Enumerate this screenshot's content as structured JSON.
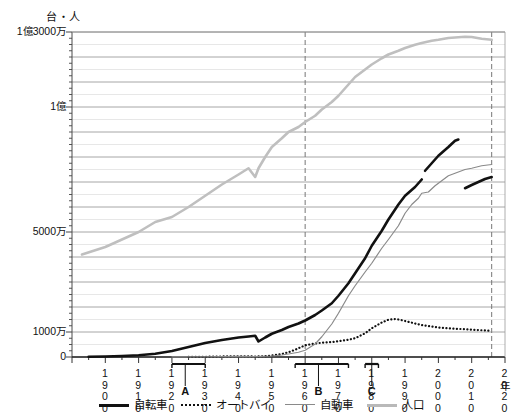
{
  "chart_data": {
    "type": "line",
    "title": "",
    "unit_label": "台・人",
    "xlabel": "年",
    "ylabel": "",
    "grid": true,
    "legend_position": "bottom",
    "xlim": [
      1890,
      2020
    ],
    "ylim": [
      0,
      130000000
    ],
    "y_ticks": [
      {
        "value": 0,
        "label": "0"
      },
      {
        "value": 10000000,
        "label": "1000万"
      },
      {
        "value": 50000000,
        "label": "5000万"
      },
      {
        "value": 100000000,
        "label": "1億"
      },
      {
        "value": 130000000,
        "label": "1億3000万"
      }
    ],
    "y_minor_gridline_step": 5000000,
    "x_ticks": [
      {
        "value": 1900,
        "label": "1900"
      },
      {
        "value": 1910,
        "label": "1910"
      },
      {
        "value": 1920,
        "label": "1920"
      },
      {
        "value": 1930,
        "label": "1930"
      },
      {
        "value": 1940,
        "label": "1940"
      },
      {
        "value": 1950,
        "label": "1950"
      },
      {
        "value": 1960,
        "label": "1960"
      },
      {
        "value": 1970,
        "label": "1970"
      },
      {
        "value": 1980,
        "label": "1980"
      },
      {
        "value": 1990,
        "label": "1990"
      },
      {
        "value": 2000,
        "label": "2000"
      },
      {
        "value": 2010,
        "label": "2010"
      },
      {
        "value": 2020,
        "label": "2020"
      }
    ],
    "vertical_dashed_lines": [
      1960,
      2016
    ],
    "brackets": [
      {
        "label": "A",
        "start": 1920,
        "end": 1930,
        "tick_at": 1924
      },
      {
        "label": "B",
        "start": 1957,
        "end": 1973,
        "tick_at": 1964
      },
      {
        "label": "C",
        "start": 1978,
        "end": 1982,
        "tick_at": 1980
      }
    ],
    "series": [
      {
        "name": "自転車",
        "style": "thick-solid",
        "color": "#111111",
        "segments": [
          [
            [
              1895,
              100000
            ],
            [
              1900,
              200000
            ],
            [
              1905,
              400000
            ],
            [
              1910,
              700000
            ],
            [
              1915,
              1300000
            ],
            [
              1920,
              2400000
            ],
            [
              1925,
              4000000
            ],
            [
              1930,
              5600000
            ],
            [
              1935,
              6800000
            ],
            [
              1938,
              7400000
            ],
            [
              1940,
              7800000
            ],
            [
              1943,
              8200000
            ],
            [
              1945,
              8500000
            ],
            [
              1946,
              6200000
            ],
            [
              1948,
              7800000
            ],
            [
              1950,
              9300000
            ],
            [
              1953,
              10800000
            ],
            [
              1955,
              12000000
            ],
            [
              1958,
              13400000
            ],
            [
              1960,
              14600000
            ],
            [
              1963,
              16800000
            ],
            [
              1965,
              18600000
            ],
            [
              1968,
              21500000
            ],
            [
              1970,
              24500000
            ],
            [
              1973,
              29500000
            ],
            [
              1975,
              33500000
            ],
            [
              1978,
              39500000
            ],
            [
              1980,
              44500000
            ],
            [
              1983,
              50500000
            ],
            [
              1985,
              55000000
            ],
            [
              1988,
              61000000
            ],
            [
              1990,
              64500000
            ],
            [
              1993,
              68000000
            ],
            [
              1995,
              71000000
            ]
          ],
          [
            [
              1996,
              74500000
            ],
            [
              1998,
              77500000
            ],
            [
              2000,
              80500000
            ],
            [
              2003,
              84000000
            ],
            [
              2005,
              86500000
            ],
            [
              2006,
              87000000
            ]
          ],
          [
            [
              2008,
              67500000
            ],
            [
              2010,
              68800000
            ],
            [
              2012,
              70000000
            ],
            [
              2014,
              71200000
            ],
            [
              2016,
              72000000
            ]
          ]
        ]
      },
      {
        "name": "オートバイ",
        "style": "dotted",
        "color": "#111111",
        "segments": [
          [
            [
              1925,
              50000
            ],
            [
              1930,
              100000
            ],
            [
              1935,
              200000
            ],
            [
              1940,
              300000
            ],
            [
              1945,
              200000
            ],
            [
              1948,
              350000
            ],
            [
              1950,
              600000
            ],
            [
              1953,
              1200000
            ],
            [
              1955,
              1900000
            ],
            [
              1957,
              2900000
            ],
            [
              1959,
              4100000
            ],
            [
              1960,
              4700000
            ],
            [
              1963,
              5400000
            ],
            [
              1965,
              5700000
            ],
            [
              1968,
              6000000
            ],
            [
              1970,
              6300000
            ],
            [
              1973,
              6900000
            ],
            [
              1975,
              7500000
            ],
            [
              1978,
              9500000
            ],
            [
              1980,
              11500000
            ],
            [
              1983,
              13800000
            ],
            [
              1985,
              14900000
            ],
            [
              1987,
              15200000
            ],
            [
              1988,
              15000000
            ],
            [
              1990,
              14400000
            ],
            [
              1993,
              13400000
            ],
            [
              1995,
              12800000
            ],
            [
              1998,
              12200000
            ],
            [
              2000,
              11800000
            ],
            [
              2003,
              11500000
            ],
            [
              2005,
              11300000
            ],
            [
              2008,
              11100000
            ],
            [
              2010,
              10900000
            ],
            [
              2013,
              10700000
            ],
            [
              2016,
              10500000
            ]
          ]
        ]
      },
      {
        "name": "自動車",
        "style": "thin-solid",
        "color": "#8a8a8a",
        "segments": [
          [
            [
              1920,
              30000
            ],
            [
              1930,
              100000
            ],
            [
              1935,
              180000
            ],
            [
              1940,
              250000
            ],
            [
              1945,
              150000
            ],
            [
              1950,
              400000
            ],
            [
              1953,
              800000
            ],
            [
              1955,
              1200000
            ],
            [
              1958,
              1900000
            ],
            [
              1960,
              2700000
            ],
            [
              1963,
              5200000
            ],
            [
              1965,
              8100000
            ],
            [
              1967,
              11500000
            ],
            [
              1968,
              13200000
            ],
            [
              1970,
              17500000
            ],
            [
              1973,
              24500000
            ],
            [
              1975,
              28500000
            ],
            [
              1978,
              34000000
            ],
            [
              1980,
              37500000
            ],
            [
              1983,
              43500000
            ],
            [
              1985,
              47000000
            ],
            [
              1988,
              52500000
            ],
            [
              1990,
              57500000
            ],
            [
              1992,
              61000000
            ],
            [
              1994,
              63500000
            ],
            [
              1995,
              65500000
            ],
            [
              1997,
              66000000
            ],
            [
              1999,
              68500000
            ],
            [
              2001,
              70500000
            ],
            [
              2003,
              72500000
            ],
            [
              2005,
              73500000
            ],
            [
              2008,
              75000000
            ],
            [
              2010,
              75500000
            ],
            [
              2013,
              76500000
            ],
            [
              2016,
              77000000
            ]
          ]
        ]
      },
      {
        "name": "人口",
        "style": "thick-light",
        "color": "#bfbfbf",
        "segments": [
          [
            [
              1893,
              41000000
            ],
            [
              1900,
              44000000
            ],
            [
              1905,
              47000000
            ],
            [
              1910,
              50000000
            ],
            [
              1915,
              54000000
            ],
            [
              1920,
              56000000
            ],
            [
              1925,
              60000000
            ],
            [
              1930,
              64500000
            ],
            [
              1935,
              69000000
            ],
            [
              1940,
              73000000
            ],
            [
              1943,
              75500000
            ],
            [
              1945,
              72000000
            ],
            [
              1946,
              75500000
            ],
            [
              1948,
              80000000
            ],
            [
              1950,
              84000000
            ],
            [
              1953,
              87500000
            ],
            [
              1955,
              90000000
            ],
            [
              1958,
              92000000
            ],
            [
              1960,
              94000000
            ],
            [
              1963,
              96500000
            ],
            [
              1965,
              99000000
            ],
            [
              1968,
              102000000
            ],
            [
              1970,
              104500000
            ],
            [
              1973,
              109000000
            ],
            [
              1975,
              112000000
            ],
            [
              1978,
              115000000
            ],
            [
              1980,
              117000000
            ],
            [
              1983,
              119500000
            ],
            [
              1985,
              121000000
            ],
            [
              1988,
              122500000
            ],
            [
              1990,
              123600000
            ],
            [
              1993,
              124900000
            ],
            [
              1995,
              125600000
            ],
            [
              1998,
              126500000
            ],
            [
              2000,
              126900000
            ],
            [
              2003,
              127600000
            ],
            [
              2005,
              127800000
            ],
            [
              2008,
              128100000
            ],
            [
              2010,
              128000000
            ],
            [
              2013,
              127300000
            ],
            [
              2016,
              126900000
            ]
          ]
        ]
      }
    ]
  },
  "legend": {
    "items": [
      {
        "label": "自転車",
        "icon": "thick-black-line-icon"
      },
      {
        "label": "オートバイ",
        "icon": "dotted-black-line-icon"
      },
      {
        "label": "自動車",
        "icon": "thin-gray-line-icon"
      },
      {
        "label": "人口",
        "icon": "thick-light-gray-line-icon"
      }
    ]
  }
}
